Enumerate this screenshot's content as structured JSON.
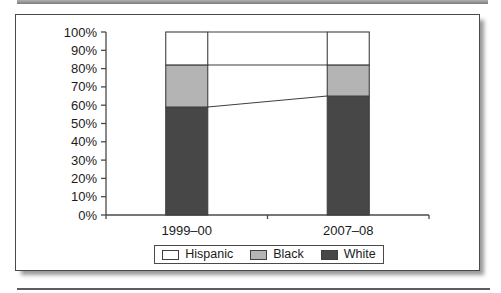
{
  "chart_data": {
    "type": "bar",
    "subtype": "stacked-100-percent-column",
    "title": "",
    "xlabel": "",
    "ylabel": "",
    "categories": [
      "1999–00",
      "2007–08"
    ],
    "series": [
      {
        "name": "Hispanic",
        "color": "#ffffff",
        "values": [
          18,
          18
        ]
      },
      {
        "name": "Black",
        "color": "#b4b4b4",
        "values": [
          23,
          17
        ]
      },
      {
        "name": "White",
        "color": "#474747",
        "values": [
          59,
          65
        ]
      }
    ],
    "stack_order_bottom_to_top": [
      "White",
      "Black",
      "Hispanic"
    ],
    "ylim": [
      0,
      100
    ],
    "ytick_step": 10,
    "ytick_labels": [
      "0%",
      "10%",
      "20%",
      "30%",
      "40%",
      "50%",
      "60%",
      "70%",
      "80%",
      "90%",
      "100%"
    ],
    "legend_position": "bottom",
    "legend_order": [
      "Hispanic",
      "Black",
      "White"
    ],
    "series_connector_lines": true,
    "grid": false,
    "axis_color": "#4a4a4a",
    "outline_color": "#3f3f3f"
  }
}
